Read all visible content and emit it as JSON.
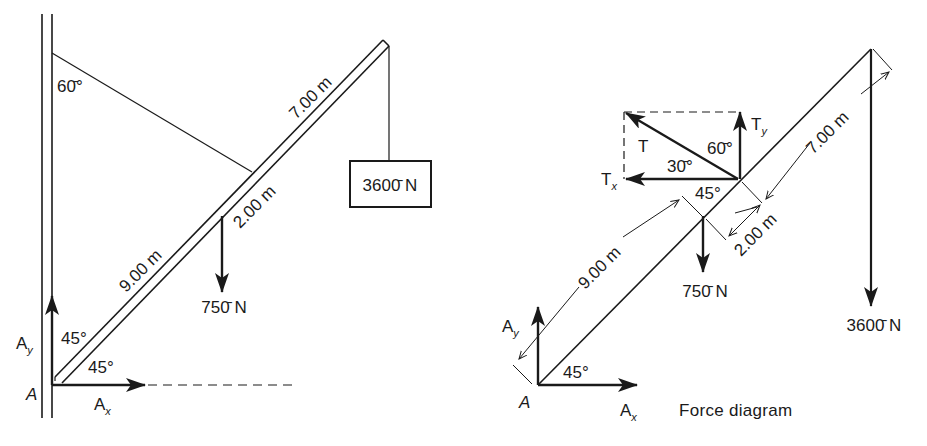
{
  "figure": {
    "left_panel": {
      "name": "Boom and cable setup",
      "angle_cable_wall": "60̄°",
      "angle_boom_wall": "45°",
      "angle_boom_horizontal": "45°",
      "segment_lower": "9.00 m",
      "segment_middle": "2.00 m",
      "segment_upper": "7.00 m",
      "weight_boom": "750̄ N",
      "load": "3600̄ N",
      "pivot_label": "A",
      "reaction_x": {
        "main": "A",
        "sub": "x"
      },
      "reaction_y": {
        "main": "A",
        "sub": "y"
      }
    },
    "right_panel": {
      "caption": "Force diagram",
      "tension_label": "T",
      "tension_x": {
        "main": "T",
        "sub": "x"
      },
      "tension_y": {
        "main": "T",
        "sub": "y"
      },
      "angle_tension_vertical": "60̄°",
      "angle_tension_horizontal": "30̄°",
      "angle_beam_at_tension": "45°",
      "angle_beam_horizontal": "45°",
      "segment_lower": "9.00 m",
      "segment_middle": "2.00 m",
      "segment_upper": "7.00 m",
      "weight_boom": "750̄ N",
      "load": "3600̄ N",
      "pivot_label": "A",
      "reaction_x": {
        "main": "A",
        "sub": "x"
      },
      "reaction_y": {
        "main": "A",
        "sub": "y"
      }
    }
  }
}
